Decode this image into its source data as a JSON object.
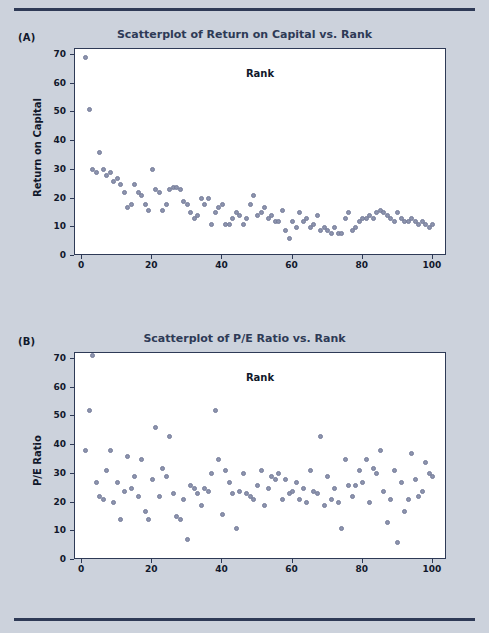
{
  "page": {
    "background_color": "#ccd2dc",
    "rule_color": "#2e3a56",
    "panel_a_letter": "(A)",
    "panel_b_letter": "(B)"
  },
  "chart_data": [
    {
      "type": "scatter",
      "panel": "(A)",
      "title": "Scatterplot of Return on Capital vs. Rank",
      "xlabel": "Rank",
      "ylabel": "Return on Capital",
      "xlim": [
        -2,
        104
      ],
      "ylim": [
        0,
        72
      ],
      "xticks": [
        0,
        20,
        40,
        60,
        80,
        100
      ],
      "yticks": [
        0,
        10,
        20,
        30,
        40,
        50,
        60,
        70
      ],
      "grid": false,
      "legend": "none",
      "marker_color": "#8c93ad",
      "x": [
        1,
        2,
        3,
        4,
        5,
        6,
        7,
        8,
        9,
        10,
        11,
        12,
        13,
        14,
        15,
        16,
        17,
        18,
        19,
        20,
        21,
        22,
        23,
        24,
        25,
        26,
        27,
        28,
        29,
        30,
        31,
        32,
        33,
        34,
        35,
        36,
        37,
        38,
        39,
        40,
        41,
        42,
        43,
        44,
        45,
        46,
        47,
        48,
        49,
        50,
        51,
        52,
        53,
        54,
        55,
        56,
        57,
        58,
        59,
        60,
        61,
        62,
        63,
        64,
        65,
        66,
        67,
        68,
        69,
        70,
        71,
        72,
        73,
        74,
        75,
        76,
        77,
        78,
        79,
        80,
        81,
        82,
        83,
        84,
        85,
        86,
        87,
        88,
        89,
        90,
        91,
        92,
        93,
        94,
        95,
        96,
        97,
        98,
        99,
        100
      ],
      "y": [
        69,
        51,
        30,
        29,
        36,
        30,
        28,
        29,
        26,
        27,
        25,
        22,
        17,
        18,
        25,
        22,
        21,
        18,
        16,
        30,
        23,
        22,
        16,
        18,
        23,
        24,
        24,
        23,
        19,
        18,
        15,
        13,
        14,
        20,
        18,
        20,
        11,
        15,
        17,
        18,
        11,
        11,
        13,
        15,
        14,
        11,
        13,
        18,
        21,
        14,
        15,
        17,
        13,
        14,
        12,
        12,
        16,
        9,
        6,
        12,
        10,
        15,
        12,
        13,
        10,
        11,
        14,
        9,
        10,
        9,
        8,
        10,
        8,
        8,
        13,
        15,
        9,
        10,
        12,
        13,
        13,
        14,
        13,
        15,
        16,
        15,
        14,
        13,
        12,
        15,
        13,
        12,
        12,
        13,
        12,
        11,
        12,
        11,
        10,
        11
      ]
    },
    {
      "type": "scatter",
      "panel": "(B)",
      "title": "Scatterplot of P/E Ratio vs. Rank",
      "xlabel": "Rank",
      "ylabel": "P/E Ratio",
      "xlim": [
        -2,
        104
      ],
      "ylim": [
        0,
        72
      ],
      "xticks": [
        0,
        20,
        40,
        60,
        80,
        100
      ],
      "yticks": [
        0,
        10,
        20,
        30,
        40,
        50,
        60,
        70
      ],
      "grid": false,
      "legend": "none",
      "marker_color": "#8c93ad",
      "x": [
        1,
        2,
        3,
        4,
        5,
        6,
        7,
        8,
        9,
        10,
        11,
        12,
        13,
        14,
        15,
        16,
        17,
        18,
        19,
        20,
        21,
        22,
        23,
        24,
        25,
        26,
        27,
        28,
        29,
        30,
        31,
        32,
        33,
        34,
        35,
        36,
        37,
        38,
        39,
        40,
        41,
        42,
        43,
        44,
        45,
        46,
        47,
        48,
        49,
        50,
        51,
        52,
        53,
        54,
        55,
        56,
        57,
        58,
        59,
        60,
        61,
        62,
        63,
        64,
        65,
        66,
        67,
        68,
        69,
        70,
        71,
        72,
        73,
        74,
        75,
        76,
        77,
        78,
        79,
        80,
        81,
        82,
        83,
        84,
        85,
        86,
        87,
        88,
        89,
        90,
        91,
        92,
        93,
        94,
        95,
        96,
        97,
        98,
        99,
        100
      ],
      "y": [
        38,
        52,
        71,
        27,
        22,
        21,
        31,
        38,
        20,
        27,
        14,
        24,
        36,
        25,
        29,
        22,
        35,
        17,
        14,
        28,
        46,
        22,
        32,
        29,
        43,
        23,
        15,
        14,
        21,
        7,
        26,
        25,
        23,
        19,
        25,
        24,
        30,
        52,
        35,
        16,
        31,
        27,
        23,
        11,
        24,
        30,
        23,
        22,
        21,
        26,
        31,
        19,
        25,
        29,
        28,
        30,
        21,
        28,
        23,
        24,
        27,
        21,
        25,
        20,
        31,
        24,
        23,
        43,
        19,
        29,
        21,
        25,
        20,
        11,
        35,
        26,
        22,
        26,
        31,
        27,
        35,
        20,
        32,
        30,
        38,
        24,
        13,
        21,
        31,
        6,
        27,
        17,
        21,
        37,
        28,
        22,
        24,
        34,
        30,
        29
      ]
    }
  ]
}
